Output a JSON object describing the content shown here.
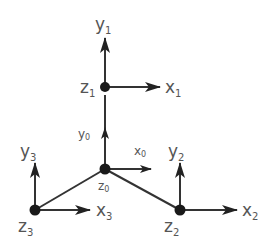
{
  "diagram": {
    "type": "coordinate-frames-tree",
    "colors": {
      "line": "#333333",
      "node": "#1a1a1a",
      "label": "#555555"
    },
    "nodes": [
      {
        "id": "z1",
        "x": 105,
        "y": 87,
        "label_base": "z",
        "label_sub": "1",
        "x_axis": {
          "base": "x",
          "sub": "1"
        },
        "y_axis": {
          "base": "y",
          "sub": "1"
        }
      },
      {
        "id": "z0",
        "x": 105,
        "y": 169,
        "label_base": "z",
        "label_sub": "0",
        "x_axis": {
          "base": "x",
          "sub": "0"
        },
        "y_axis": {
          "base": "y",
          "sub": "0"
        }
      },
      {
        "id": "z3",
        "x": 35,
        "y": 210,
        "label_base": "z",
        "label_sub": "3",
        "x_axis": {
          "base": "x",
          "sub": "3"
        },
        "y_axis": {
          "base": "y",
          "sub": "3"
        }
      },
      {
        "id": "z2",
        "x": 180,
        "y": 210,
        "label_base": "z",
        "label_sub": "2",
        "x_axis": {
          "base": "x",
          "sub": "2"
        },
        "y_axis": {
          "base": "y",
          "sub": "2"
        }
      }
    ],
    "edges": [
      {
        "from": "z0",
        "to": "z1"
      },
      {
        "from": "z0",
        "to": "z3"
      },
      {
        "from": "z0",
        "to": "z2"
      }
    ],
    "labels": {
      "y1": {
        "base": "y",
        "sub": "1"
      },
      "x1": {
        "base": "x",
        "sub": "1"
      },
      "z1": {
        "base": "z",
        "sub": "1"
      },
      "y0": {
        "base": "y",
        "sub": "0"
      },
      "x0": {
        "base": "x",
        "sub": "0"
      },
      "z0": {
        "base": "z",
        "sub": "0"
      },
      "y3": {
        "base": "y",
        "sub": "3"
      },
      "x3": {
        "base": "x",
        "sub": "3"
      },
      "z3": {
        "base": "z",
        "sub": "3"
      },
      "y2": {
        "base": "y",
        "sub": "2"
      },
      "x2": {
        "base": "x",
        "sub": "2"
      },
      "z2": {
        "base": "z",
        "sub": "2"
      }
    }
  }
}
